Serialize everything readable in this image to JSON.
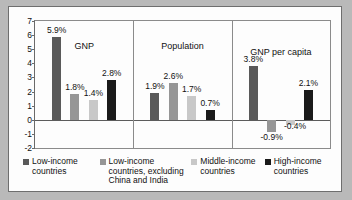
{
  "chart_data": {
    "type": "bar",
    "title": "",
    "xlabel": "",
    "ylabel": "",
    "ylim": [
      -2,
      7
    ],
    "yticks": [
      7,
      6,
      5,
      4,
      3,
      2,
      1,
      0,
      -1,
      -2
    ],
    "ytick_labels": [
      "7",
      "6",
      "5",
      "4",
      "3",
      "2",
      "1",
      "0",
      "-1",
      "-2"
    ],
    "grid": false,
    "legend_position": "bottom",
    "categories": [
      "GNP",
      "Population",
      "GNP per capita"
    ],
    "series": [
      {
        "name": "Low-income countries",
        "color": "#595959",
        "values": [
          5.9,
          1.9,
          3.8
        ],
        "labels": [
          "5.9%",
          "1.9%",
          "3.8%"
        ]
      },
      {
        "name": "Low-income countries, excluding China and India",
        "color": "#969696",
        "values": [
          1.8,
          2.6,
          -0.9
        ],
        "labels": [
          "1.8%",
          "2.6%",
          "-0.9%"
        ]
      },
      {
        "name": "Middle-income countries",
        "color": "#c8c8c8",
        "values": [
          1.4,
          1.7,
          -0.4
        ],
        "labels": [
          "1.4%",
          "1.7%",
          "-0.4%"
        ]
      },
      {
        "name": "High-income countries",
        "color": "#1a1a1a",
        "values": [
          2.8,
          0.7,
          2.1
        ],
        "labels": [
          "2.8%",
          "0.7%",
          "2.1%"
        ]
      }
    ]
  },
  "panels": [
    {
      "title": "GNP"
    },
    {
      "title": "Population"
    },
    {
      "title": "GNP per capita"
    }
  ],
  "legend": [
    {
      "label_line1": "Low-income",
      "label_line2": "countries",
      "label_line3": "",
      "color": "#595959"
    },
    {
      "label_line1": "Low-income",
      "label_line2": "countries, excluding",
      "label_line3": "China and India",
      "color": "#969696"
    },
    {
      "label_line1": "Middle-income",
      "label_line2": "countries",
      "label_line3": "",
      "color": "#c8c8c8"
    },
    {
      "label_line1": "High-income",
      "label_line2": "countries",
      "label_line3": "",
      "color": "#1a1a1a"
    }
  ]
}
